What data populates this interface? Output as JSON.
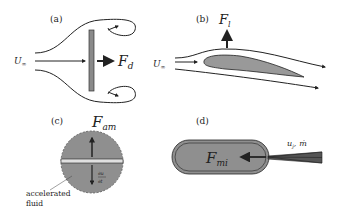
{
  "panels": {
    "a": {
      "label": "(a)",
      "freestream": "U",
      "freestream_sub": "∞",
      "force": "F",
      "force_sub": "d"
    },
    "b": {
      "label": "(b)",
      "freestream": "U",
      "freestream_sub": "∞",
      "force": "F",
      "force_sub": "l"
    },
    "c": {
      "label": "(c)",
      "force": "F",
      "force_sub": "am",
      "deriv_num": "∂u",
      "deriv_den": "∂t",
      "annotation_line1": "accelerated",
      "annotation_line2": "fluid"
    },
    "d": {
      "label": "(d)",
      "force": "F",
      "force_sub": "mi",
      "jet_label": "u",
      "jet_sub": "j",
      "jet_sep": ",",
      "massflow": "ṁ"
    }
  },
  "colors": {
    "fill": "#999999",
    "stroke": "#222222",
    "plate": "#8a8a8a"
  }
}
